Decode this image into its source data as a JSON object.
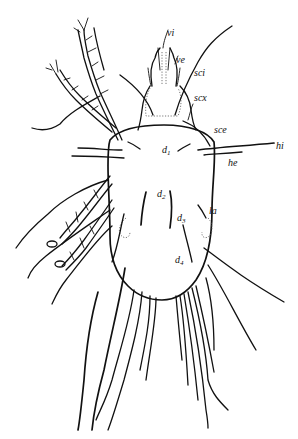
{
  "figure": {
    "stroke_color": "#111111",
    "background": "#ffffff",
    "labels": [
      {
        "id": "vi",
        "text": "vi",
        "x": 167,
        "y": 36
      },
      {
        "id": "ve",
        "text": "ve",
        "x": 176,
        "y": 63
      },
      {
        "id": "sci",
        "text": "sci",
        "x": 194,
        "y": 76
      },
      {
        "id": "scx",
        "text": "scx",
        "x": 194,
        "y": 101
      },
      {
        "id": "sce",
        "text": "sce",
        "x": 214,
        "y": 133
      },
      {
        "id": "hi",
        "text": "hi",
        "x": 276,
        "y": 149
      },
      {
        "id": "d1",
        "text": "d",
        "sub": "1",
        "x": 162,
        "y": 153
      },
      {
        "id": "he",
        "text": "he",
        "x": 228,
        "y": 166
      },
      {
        "id": "d2",
        "text": "d",
        "sub": "2",
        "x": 157,
        "y": 197
      },
      {
        "id": "la",
        "text": "la",
        "x": 209,
        "y": 214
      },
      {
        "id": "d3",
        "text": "d",
        "sub": "3",
        "x": 177,
        "y": 221
      },
      {
        "id": "d4",
        "text": "d",
        "sub": "4",
        "x": 175,
        "y": 263
      }
    ]
  }
}
